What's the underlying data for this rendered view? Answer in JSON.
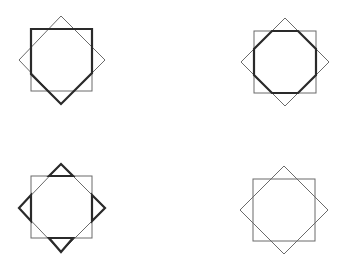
{
  "figures": [
    {
      "id": "fig-top-left",
      "square": {
        "x1": 31,
        "y1": 29,
        "x2": 92,
        "y2": 91
      },
      "diamond": {
        "top": [
          61,
          16
        ],
        "right": [
          105,
          60
        ],
        "bottom": [
          61,
          104
        ],
        "left": [
          19,
          60
        ]
      },
      "highlight": "pentagon",
      "bold_path": [
        [
          31,
          29
        ],
        [
          92,
          29
        ],
        [
          92,
          73
        ],
        [
          61,
          104
        ],
        [
          31,
          74
        ]
      ]
    },
    {
      "id": "fig-top-right",
      "square": {
        "x1": 254,
        "y1": 31,
        "x2": 316,
        "y2": 93
      },
      "diamond": {
        "top": [
          285,
          18
        ],
        "right": [
          329,
          62
        ],
        "bottom": [
          285,
          106
        ],
        "left": [
          241,
          62
        ]
      },
      "highlight": "octagon",
      "bold_path": [
        [
          272,
          31
        ],
        [
          298,
          31
        ],
        [
          316,
          49
        ],
        [
          316,
          75
        ],
        [
          298,
          93
        ],
        [
          272,
          93
        ],
        [
          254,
          75
        ],
        [
          254,
          49
        ]
      ]
    },
    {
      "id": "fig-bottom-left",
      "square": {
        "x1": 31,
        "y1": 176,
        "x2": 92,
        "y2": 238
      },
      "diamond": {
        "top": [
          61,
          164
        ],
        "right": [
          105,
          208
        ],
        "bottom": [
          61,
          252
        ],
        "left": [
          19,
          208
        ]
      },
      "highlight": "four-triangles",
      "bold_triangles": [
        [
          [
            49,
            176
          ],
          [
            61,
            164
          ],
          [
            73,
            176
          ]
        ],
        [
          [
            92,
            195
          ],
          [
            105,
            208
          ],
          [
            92,
            221
          ]
        ],
        [
          [
            73,
            238
          ],
          [
            61,
            252
          ],
          [
            49,
            238
          ]
        ],
        [
          [
            31,
            221
          ],
          [
            19,
            208
          ],
          [
            31,
            195
          ]
        ]
      ]
    },
    {
      "id": "fig-bottom-right",
      "square": {
        "x1": 253,
        "y1": 179,
        "x2": 315,
        "y2": 241
      },
      "diamond": {
        "top": [
          284,
          166
        ],
        "right": [
          328,
          210
        ],
        "bottom": [
          284,
          254
        ],
        "left": [
          240,
          210
        ]
      },
      "highlight": "none"
    }
  ],
  "colors": {
    "thin_stroke": "#6a6a6a",
    "bold_stroke": "#2a2a2a",
    "background": "#ffffff"
  }
}
